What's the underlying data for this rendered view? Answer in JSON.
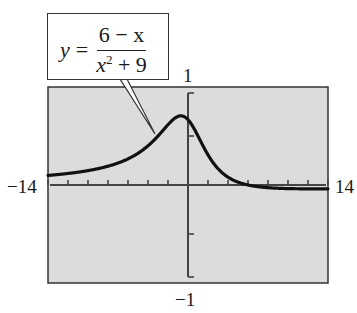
{
  "chart_data": {
    "type": "line",
    "title": "",
    "function": "y = (6 - x) / (x^2 + 9)",
    "xlabel": "",
    "ylabel": "",
    "xlim": [
      -14,
      14
    ],
    "ylim": [
      -1,
      1
    ],
    "x_tick_step": 2,
    "y_tick_step": 0.5,
    "grid": false,
    "background": "#dcdcdc",
    "curve_color": "#111111",
    "window_labels": {
      "xmin": "−14",
      "xmax": "14",
      "ymin": "−1",
      "ymax": "1"
    },
    "series": [
      {
        "name": "y = (6 − x)/(x² + 9)",
        "x": [
          -14,
          -12,
          -10,
          -8,
          -6,
          -4,
          -2,
          -1,
          -0.71,
          0,
          1,
          2,
          4,
          6,
          8,
          10,
          12,
          14
        ],
        "values": [
          0.098,
          0.118,
          0.147,
          0.192,
          0.267,
          0.4,
          0.615,
          0.7,
          0.706,
          0.667,
          0.5,
          0.308,
          0.08,
          0.0,
          -0.027,
          -0.037,
          -0.039,
          -0.039
        ]
      }
    ],
    "annotations": [
      {
        "text": "y = (6 − x)/(x² + 9)",
        "type": "callout",
        "points_to": "curve"
      }
    ]
  },
  "equation": {
    "lhs": "y",
    "equals": "=",
    "numerator": "6 − x",
    "denominator_var": "x",
    "denominator_exp": "2",
    "denominator_rest": " + 9"
  }
}
